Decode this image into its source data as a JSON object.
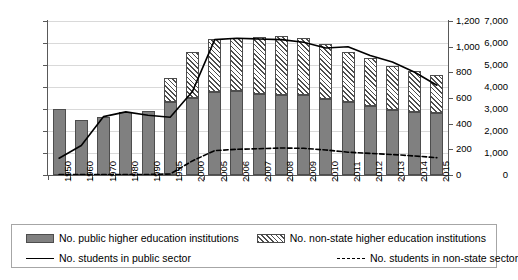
{
  "chart_data": {
    "type": "bar",
    "title": "",
    "subtitle": "",
    "xlabel": "",
    "ylabel": "",
    "grid": true,
    "legend_position": "bottom",
    "categories": [
      "1950",
      "1960",
      "1970",
      "1980",
      "1990",
      "1995",
      "2000",
      "2005",
      "2006",
      "2007",
      "2008",
      "2009",
      "2010",
      "2011",
      "2012",
      "2013",
      "2014",
      "2015"
    ],
    "x": [
      "1950",
      "1960",
      "1970",
      "1980",
      "1990",
      "1995",
      "2000",
      "2005",
      "2006",
      "2007",
      "2008",
      "2009",
      "2010",
      "2011",
      "2012",
      "2013",
      "2014",
      "2015"
    ],
    "left_axis": {
      "label": "",
      "ylim": [
        0,
        7000
      ],
      "ticks": [
        0,
        1000,
        2000,
        3000,
        4000,
        5000,
        6000,
        7000
      ],
      "ticklabels": [
        "0",
        "1,000",
        "2,000",
        "3,000",
        "4,000",
        "5,000",
        "6,000",
        "7,000"
      ]
    },
    "right_axis": {
      "label": "",
      "ylim": [
        0,
        1200
      ],
      "ticks": [
        0,
        200,
        400,
        600,
        800,
        1000,
        1200
      ],
      "ticklabels": [
        "0",
        "200",
        "400",
        "600",
        "800",
        "1,000",
        "1,200"
      ]
    },
    "series": [
      {
        "name": "No. public higher education institutions",
        "type": "bar",
        "stack": "institutions",
        "axis": "left",
        "color": "#808080",
        "pattern": "solid",
        "values": [
          3000,
          2500,
          2650,
          2880,
          2900,
          3300,
          3520,
          3780,
          3800,
          3680,
          3650,
          3620,
          3470,
          3300,
          3150,
          2970,
          2870,
          2820
        ]
      },
      {
        "name": "No. non-state higher education institutions",
        "type": "bar",
        "stack": "institutions",
        "axis": "left",
        "color": "#ffffff",
        "pattern": "diagonal-hatch",
        "values": [
          0,
          0,
          0,
          0,
          0,
          1100,
          2080,
          2420,
          2450,
          2580,
          2650,
          2630,
          2500,
          2300,
          2170,
          1990,
          1880,
          1750
        ]
      },
      {
        "name": "No. students in public sector",
        "type": "line",
        "axis": "right",
        "color": "#000000",
        "style": "solid",
        "values": [
          131,
          230,
          455,
          492,
          465,
          450,
          650,
          1055,
          1065,
          1060,
          1055,
          1035,
          990,
          1000,
          930,
          880,
          800,
          700
        ]
      },
      {
        "name": "No. students in non-state sector",
        "type": "line",
        "axis": "right",
        "color": "#000000",
        "style": "dashed",
        "values": [
          3,
          3,
          3,
          3,
          4,
          8,
          110,
          190,
          200,
          205,
          210,
          208,
          195,
          178,
          168,
          160,
          148,
          135
        ]
      }
    ]
  },
  "legend": {
    "items": [
      {
        "label": "No. public higher education institutions",
        "marker": "bar-solid-gray"
      },
      {
        "label": "No. non-state higher education institutions",
        "marker": "bar-hatched"
      },
      {
        "label": "No. students in public sector",
        "marker": "line-solid"
      },
      {
        "label": "No. students in non-state sector",
        "marker": "line-dashed"
      }
    ]
  }
}
